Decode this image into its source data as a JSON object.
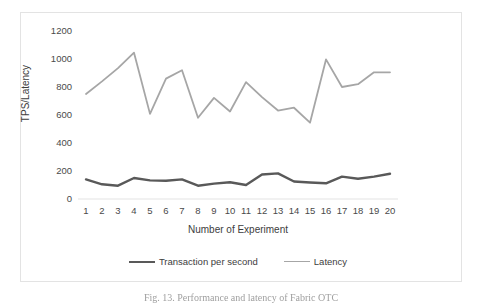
{
  "figure": {
    "caption": "Fig. 13.   Performance and latency of Fabric OTC"
  },
  "chart_data": {
    "type": "line",
    "title": "",
    "xlabel": "Number of Experiment",
    "ylabel": "TPS/Latency",
    "x": [
      1,
      2,
      3,
      4,
      5,
      6,
      7,
      8,
      9,
      10,
      11,
      12,
      13,
      14,
      15,
      16,
      17,
      18,
      19,
      20
    ],
    "xtick_labels": [
      "1",
      "2",
      "3",
      "4",
      "5",
      "6",
      "7",
      "8",
      "9",
      "10",
      "11",
      "12",
      "13",
      "14",
      "15",
      "16",
      "17",
      "18",
      "19",
      "20"
    ],
    "ytick_labels": [
      "0",
      "200",
      "400",
      "600",
      "800",
      "1000",
      "1200"
    ],
    "yticks": [
      0,
      200,
      400,
      600,
      800,
      1000,
      1200
    ],
    "ylim": [
      0,
      1200
    ],
    "grid": false,
    "legend_position": "bottom",
    "series": [
      {
        "name": "Transaction per second",
        "color": "#595959",
        "width": 2.4,
        "values": [
          140,
          105,
          95,
          150,
          133,
          130,
          140,
          95,
          110,
          120,
          100,
          175,
          183,
          125,
          118,
          112,
          160,
          145,
          160,
          180
        ]
      },
      {
        "name": "Latency",
        "color": "#a6a6a6",
        "width": 1.8,
        "values": [
          750,
          840,
          935,
          1045,
          608,
          860,
          920,
          580,
          722,
          625,
          835,
          728,
          632,
          652,
          545,
          997,
          800,
          820,
          905,
          905
        ]
      }
    ]
  }
}
